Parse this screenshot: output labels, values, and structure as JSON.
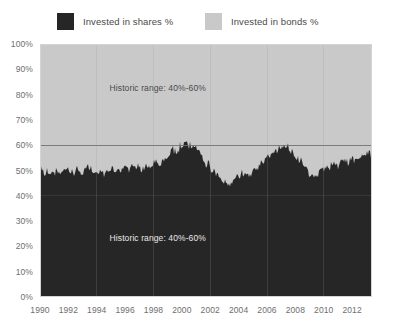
{
  "legend": {
    "position": "top",
    "entries": [
      {
        "label": "Invested in shares %",
        "color": "#262626",
        "icon": "legend-swatch-icon"
      },
      {
        "label": "Invested in bonds %",
        "color": "#c9c9c9",
        "icon": "legend-swatch-icon"
      }
    ]
  },
  "annotations": [
    {
      "text": "Historic range: 40%-60%",
      "x_year": 1998.3,
      "y_value": 82.5,
      "placement": "light-region"
    },
    {
      "text": "Historic range: 40%-60%",
      "x_year": 1998.3,
      "y_value": 23.5,
      "placement": "dark-region"
    }
  ],
  "chart_data": {
    "type": "area",
    "stacked": true,
    "stack_total": 100,
    "title": "",
    "subtitle": "",
    "xlabel": "",
    "ylabel": "",
    "xlim": [
      1990,
      2013.4
    ],
    "ylim": [
      0,
      100
    ],
    "grid": false,
    "legend_position": "top",
    "y_ticks": [
      0,
      10,
      20,
      30,
      40,
      50,
      60,
      70,
      80,
      90,
      100
    ],
    "y_tick_labels": [
      "0%",
      "10%",
      "20%",
      "30%",
      "40%",
      "50%",
      "60%",
      "70%",
      "80%",
      "90%",
      "100%"
    ],
    "x_ticks": [
      1990,
      1992,
      1994,
      1996,
      1998,
      2000,
      2002,
      2004,
      2006,
      2008,
      2010,
      2012
    ],
    "x_tick_labels": [
      "1990",
      "1992",
      "1994",
      "1996",
      "1998",
      "2000",
      "2002",
      "2004",
      "2006",
      "2008",
      "2010",
      "2012"
    ],
    "reference_lines": [
      {
        "value": 60,
        "label": "Historic range upper bound",
        "color": "#6e6e6e"
      },
      {
        "value": 40,
        "label": "Historic range lower bound",
        "color": "#4a4a4a"
      }
    ],
    "series": [
      {
        "name": "Invested in shares %",
        "color": "#262626",
        "x": [
          1990.0,
          1990.3,
          1990.6,
          1990.9,
          1991.2,
          1991.5,
          1991.8,
          1992.1,
          1992.4,
          1992.7,
          1993.0,
          1993.3,
          1993.6,
          1993.9,
          1994.2,
          1994.5,
          1994.8,
          1995.1,
          1995.4,
          1995.7,
          1996.0,
          1996.3,
          1996.6,
          1996.9,
          1997.2,
          1997.5,
          1997.8,
          1998.1,
          1998.4,
          1998.7,
          1999.0,
          1999.3,
          1999.6,
          1999.9,
          2000.2,
          2000.5,
          2000.8,
          2001.1,
          2001.4,
          2001.7,
          2002.0,
          2002.3,
          2002.6,
          2002.9,
          2003.2,
          2003.5,
          2003.8,
          2004.1,
          2004.4,
          2004.7,
          2005.0,
          2005.3,
          2005.6,
          2005.9,
          2006.2,
          2006.5,
          2006.8,
          2007.1,
          2007.4,
          2007.7,
          2008.0,
          2008.3,
          2008.6,
          2008.9,
          2009.2,
          2009.5,
          2009.8,
          2010.1,
          2010.4,
          2010.7,
          2011.0,
          2011.3,
          2011.6,
          2011.9,
          2012.2,
          2012.5,
          2012.8,
          2013.1,
          2013.4
        ],
        "values": [
          50,
          49,
          50,
          48,
          50,
          49,
          51,
          50,
          49,
          50,
          49,
          51,
          50,
          49,
          50,
          48,
          50,
          51,
          50,
          49,
          51,
          50,
          52,
          51,
          50,
          52,
          51,
          53,
          52,
          54,
          56,
          58,
          57,
          60,
          61,
          59,
          60,
          58,
          56,
          53,
          51,
          49,
          47,
          45,
          44,
          45,
          47,
          48,
          49,
          48,
          50,
          51,
          53,
          54,
          56,
          57,
          58,
          59,
          60,
          58,
          56,
          54,
          52,
          49,
          47,
          48,
          50,
          52,
          51,
          53,
          52,
          54,
          53,
          55,
          54,
          56,
          55,
          57,
          56
        ]
      },
      {
        "name": "Invested in bonds %",
        "color": "#c9c9c9",
        "x": [
          1990.0,
          1990.3,
          1990.6,
          1990.9,
          1991.2,
          1991.5,
          1991.8,
          1992.1,
          1992.4,
          1992.7,
          1993.0,
          1993.3,
          1993.6,
          1993.9,
          1994.2,
          1994.5,
          1994.8,
          1995.1,
          1995.4,
          1995.7,
          1996.0,
          1996.3,
          1996.6,
          1996.9,
          1997.2,
          1997.5,
          1997.8,
          1998.1,
          1998.4,
          1998.7,
          1999.0,
          1999.3,
          1999.6,
          1999.9,
          2000.2,
          2000.5,
          2000.8,
          2001.1,
          2001.4,
          2001.7,
          2002.0,
          2002.3,
          2002.6,
          2002.9,
          2003.2,
          2003.5,
          2003.8,
          2004.1,
          2004.4,
          2004.7,
          2005.0,
          2005.3,
          2005.6,
          2005.9,
          2006.2,
          2006.5,
          2006.8,
          2007.1,
          2007.4,
          2007.7,
          2008.0,
          2008.3,
          2008.6,
          2008.9,
          2009.2,
          2009.5,
          2009.8,
          2010.1,
          2010.4,
          2010.7,
          2011.0,
          2011.3,
          2011.6,
          2011.9,
          2012.2,
          2012.5,
          2012.8,
          2013.1,
          2013.4
        ],
        "values": [
          50,
          51,
          50,
          52,
          50,
          51,
          49,
          50,
          51,
          50,
          51,
          49,
          50,
          51,
          50,
          52,
          50,
          49,
          50,
          51,
          49,
          50,
          48,
          49,
          50,
          48,
          49,
          47,
          48,
          46,
          44,
          42,
          43,
          40,
          39,
          41,
          40,
          42,
          44,
          47,
          49,
          51,
          53,
          55,
          56,
          55,
          53,
          52,
          51,
          52,
          50,
          49,
          47,
          46,
          44,
          43,
          42,
          41,
          40,
          42,
          44,
          46,
          48,
          51,
          53,
          52,
          50,
          48,
          49,
          47,
          48,
          46,
          47,
          45,
          46,
          44,
          45,
          43,
          44
        ]
      }
    ]
  }
}
